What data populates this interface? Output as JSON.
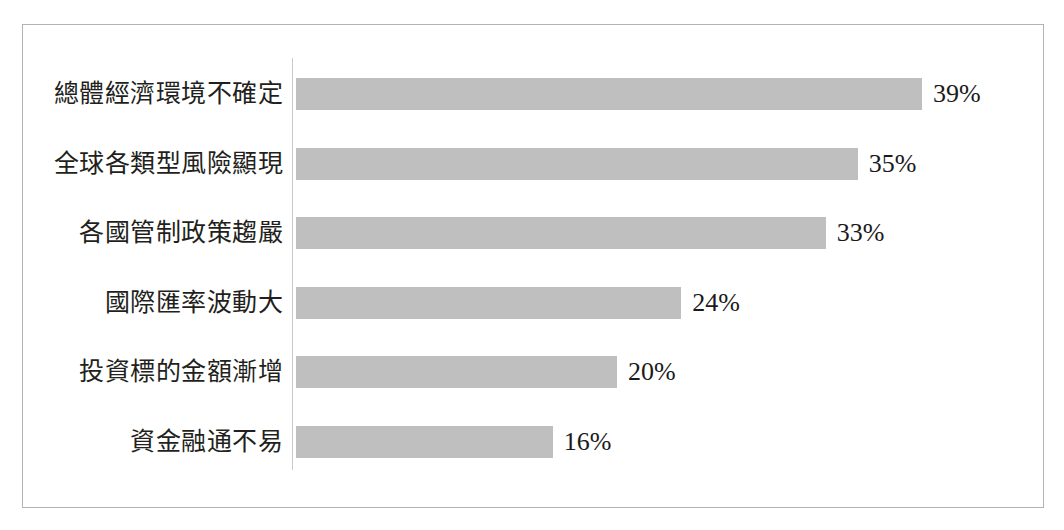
{
  "chart_data": {
    "type": "bar",
    "orientation": "horizontal",
    "title": "",
    "subtitle": "",
    "xlabel": "",
    "ylabel": "",
    "grid": false,
    "legend": null,
    "axis_line": "vertical category axis at left of bars",
    "xlim": [
      0,
      45
    ],
    "value_suffix": "%",
    "categories": [
      "總體經濟環境不確定",
      "全球各類型風險顯現",
      "各國管制政策趨嚴",
      "國際匯率波動大",
      "投資標的金額漸增",
      "資金融通不易"
    ],
    "values": [
      39,
      35,
      33,
      24,
      20,
      16
    ],
    "value_labels": [
      "39%",
      "35%",
      "33%",
      "24%",
      "20%",
      "16%"
    ],
    "bars": [
      {
        "category": "總體經濟環境不確定",
        "value": 39,
        "label": "39%"
      },
      {
        "category": "全球各類型風險顯現",
        "value": 35,
        "label": "35%"
      },
      {
        "category": "各國管制政策趨嚴",
        "value": 33,
        "label": "33%"
      },
      {
        "category": "國際匯率波動大",
        "value": 24,
        "label": "24%"
      },
      {
        "category": "投資標的金額漸增",
        "value": 20,
        "label": "20%"
      },
      {
        "category": "資金融通不易",
        "value": 16,
        "label": "16%"
      }
    ],
    "colors": {
      "bar": "#bfbfbf",
      "frame": "#b3b3b3",
      "axis": "#c9c9c9",
      "text": "#231f20",
      "background": "#ffffff"
    }
  }
}
